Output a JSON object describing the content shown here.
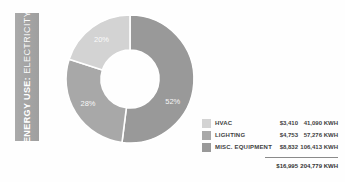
{
  "title_bar": {
    "label_primary": "ENERGY USE:",
    "label_secondary": "ELECTRICITY",
    "bg_color": "#a4a4a4",
    "text_color": "#ffffff"
  },
  "chart_data": {
    "type": "pie",
    "donut": true,
    "title": "ENERGY USE: ELECTRICITY",
    "units": [
      "USD",
      "KWH"
    ],
    "start_angle_deg": 0,
    "draw_order": [
      2,
      1,
      0
    ],
    "legend_position": "bottom-right",
    "segment_label_color": "#ffffff",
    "segments": [
      {
        "label": "HVAC",
        "percent": 20,
        "percent_label": "20%",
        "cost": "$3,410",
        "kwh": "41,090 KWH",
        "color": "#d3d3d3",
        "label_angle_deg": 324
      },
      {
        "label": "LIGHTING",
        "percent": 28,
        "percent_label": "28%",
        "cost": "$4,753",
        "kwh": "57,276 KWH",
        "color": "#a8a8a8",
        "label_angle_deg": 240
      },
      {
        "label": "MISC. EQUIPMENT",
        "percent": 52,
        "percent_label": "52%",
        "cost": "$8,832",
        "kwh": "106,413 KWH",
        "color": "#999999",
        "label_angle_deg": 118
      }
    ],
    "totals": {
      "cost": "$16,995",
      "kwh": "204,779 KWH"
    }
  }
}
